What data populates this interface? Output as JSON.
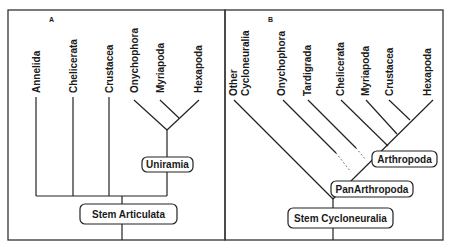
{
  "panel_a": {
    "letter": "A",
    "taxa": [
      "Annelida",
      "Chelicerata",
      "Crustacea",
      "Onychophora",
      "Myriapoda",
      "Hexapoda"
    ],
    "nodes": {
      "uniramia": "Uniramia",
      "stem": "Stem Articulata"
    }
  },
  "panel_b": {
    "letter": "B",
    "taxa": [
      "Other",
      "Cycloneuralia",
      "Onychophora",
      "Tardigrada",
      "Chelicerata",
      "Myriapoda",
      "Crustacea",
      "Hexapoda"
    ],
    "nodes": {
      "arthropoda": "Arthropoda",
      "panarthropoda": "PanArthropoda",
      "stem": "Stem Cycloneuralia"
    }
  },
  "colors": {
    "line": "#222222",
    "background": "#ffffff"
  }
}
